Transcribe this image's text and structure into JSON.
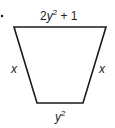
{
  "figure": {
    "type": "isosceles-trapezoid",
    "bullet": "•",
    "labels": {
      "top": {
        "coef": "2",
        "var": "y",
        "exp": "2",
        "tail": " + 1"
      },
      "left": "x",
      "right": "x",
      "bottom": {
        "var": "y",
        "exp": "2"
      }
    },
    "colors": {
      "stroke": "#1a1a1a",
      "text": "#222222",
      "background": "#ffffff"
    }
  }
}
